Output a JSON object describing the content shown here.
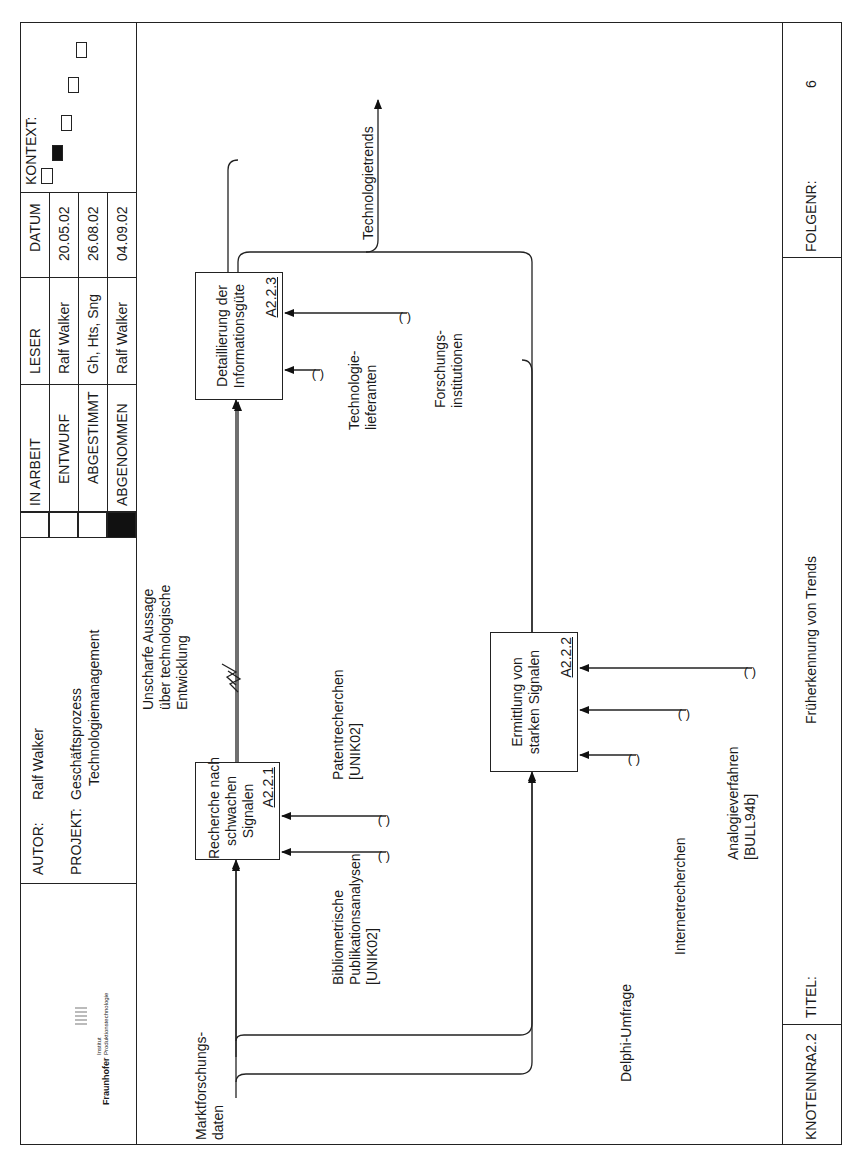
{
  "header": {
    "logo": {
      "brand": "Fraunhofer",
      "line1": "Institut",
      "line2": "Produktionstechnologie"
    },
    "autor_label": "AUTOR:",
    "autor_value": "Ralf Walker",
    "projekt_label": "PROJEKT:",
    "projekt_value_line1": "Geschäftsprozess",
    "projekt_value_line2": "Technologiemanagement",
    "status": [
      {
        "label": "IN ARBEIT",
        "checked": false
      },
      {
        "label": "ENTWURF",
        "checked": false
      },
      {
        "label": "ABGESTIMMT",
        "checked": false
      },
      {
        "label": "ABGENOMMEN",
        "checked": true
      }
    ],
    "leser_header": "LESER",
    "datum_header": "DATUM",
    "rows": [
      {
        "leser": "Ralf Walker",
        "datum": "20.05.02"
      },
      {
        "leser": "Gh, Hts, Sng",
        "datum": "26.08.02"
      },
      {
        "leser": "Ralf Walker",
        "datum": "04.09.02"
      }
    ],
    "kontext_label": "KONTEXT:",
    "kontext_boxes": [
      false,
      true,
      false,
      false,
      false
    ]
  },
  "diagram": {
    "activities": [
      {
        "id": "A2.2.1",
        "title": "Recherche nach\nschwachen\nSignalen"
      },
      {
        "id": "A2.2.2",
        "title": "Ermittlung von\nstarken Signalen"
      },
      {
        "id": "A2.2.3",
        "title": "Detaillierung der\nInformationsgüte"
      }
    ],
    "arrows": {
      "input_marktforschung": "Marktforschungs-\ndaten",
      "intermediate_unscharf": "Unscharfe Aussage\nüber technologische\nEntwicklung",
      "output_trends": "Technologietrends",
      "mech_biblio": "Bibliometrische\nPublikationsanalysen\n[UNIK02]",
      "mech_patent": "Patentrecherchen\n[UNIK02]",
      "mech_delphi": "Delphi-Umfrage",
      "mech_internet": "Internetrecherchen",
      "mech_analogie": "Analogieverfahren\n[BULL94b]",
      "mech_techliefer": "Technologie-\nlieferanten",
      "mech_forschung": "Forschungs-\ninstitutionen",
      "tunnel": "( )"
    }
  },
  "footer": {
    "knotennr_label": "KNOTENNR:",
    "knotennr_value": "A2.2",
    "titel_label": "TITEL:",
    "titel_value": "Früherkennung von Trends",
    "folgenr_label": "FOLGENR:",
    "folgenr_value": "6"
  }
}
